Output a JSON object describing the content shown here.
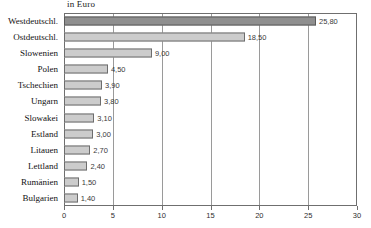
{
  "chart_data": {
    "type": "bar",
    "orientation": "horizontal",
    "title": "in Euro",
    "xlabel": "",
    "ylabel": "",
    "xlim": [
      0,
      30
    ],
    "xticks": [
      "0",
      "5",
      "10",
      "15",
      "20",
      "25",
      "30"
    ],
    "xtick_values": [
      0,
      5,
      10,
      15,
      20,
      25,
      30
    ],
    "grid": true,
    "legend": false,
    "categories": [
      "Westdeutschl.",
      "Ostdeutschl.",
      "Slowenien",
      "Polen",
      "Tschechien",
      "Ungarn",
      "Slowakei",
      "Estland",
      "Litauen",
      "Lettland",
      "Rumänien",
      "Bulgarien"
    ],
    "values": [
      25.8,
      18.5,
      9.0,
      4.5,
      3.9,
      3.8,
      3.1,
      3.0,
      2.7,
      2.4,
      1.5,
      1.4
    ],
    "value_labels": [
      "25,80",
      "18,50",
      "9,00",
      "4,50",
      "3,90",
      "3,80",
      "3,10",
      "3,00",
      "2,70",
      "2,40",
      "1,50",
      "1,40"
    ],
    "bar_colors": [
      "#8f8f8f",
      "#cccccc",
      "#cccccc",
      "#cccccc",
      "#cccccc",
      "#cccccc",
      "#cccccc",
      "#cccccc",
      "#cccccc",
      "#cccccc",
      "#cccccc",
      "#cccccc"
    ],
    "colors": {
      "highlight_bar": "#8f8f8f",
      "standard_bar": "#cccccc",
      "bar_outline": "#6d6d6d",
      "gridline": "#9a9a9a",
      "axis": "#6f6f6f",
      "text": "#111111",
      "background": "#ffffff"
    }
  }
}
